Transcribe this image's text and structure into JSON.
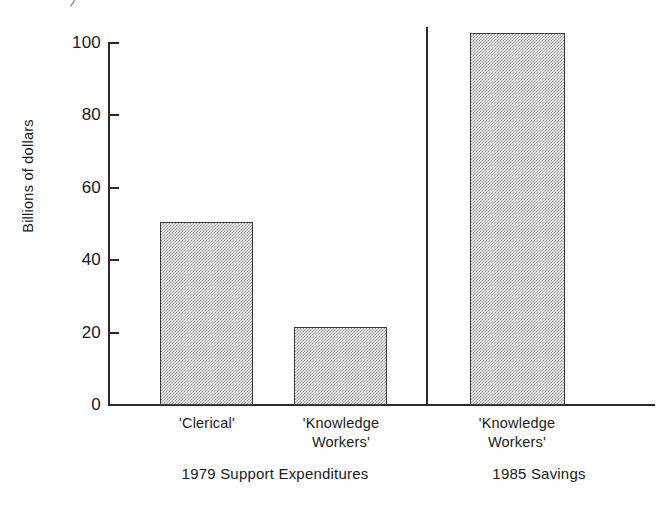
{
  "chart_data": {
    "type": "bar",
    "title": "",
    "subtitle": "",
    "xlabel": "",
    "ylabel": "Billions of dollars",
    "ylim": [
      0,
      110
    ],
    "yticks": [
      0,
      20,
      40,
      60,
      80,
      100
    ],
    "ytick_labels": [
      "0",
      "20",
      "40",
      "60",
      "80",
      "100"
    ],
    "grid": false,
    "legend": "none",
    "categories": [
      "'Clerical'",
      "'Knowledge\nWorkers'",
      "'Knowledge\nWorkers'"
    ],
    "values": [
      50.5,
      21.5,
      102.5
    ],
    "series": [
      {
        "name": "Billions of dollars",
        "values": [
          50.5,
          21.5,
          102.5
        ]
      }
    ],
    "group_captions": [
      "1979 Support Expenditures",
      "1985 Savings"
    ],
    "group_membership": [
      0,
      0,
      1
    ],
    "annotations": [
      {
        "type": "divider",
        "text": "",
        "note": "vertical rule separating the 1979 group from the 1985 group"
      }
    ],
    "bar_fill": "#efefef",
    "bar_pattern": "fine checkerboard dots",
    "bar_edge_color": "#3a3a3a",
    "axis_color": "#2b2b2b"
  },
  "axis": {
    "y_title": "Billions of dollars",
    "ticks": [
      {
        "label": "100",
        "value": 100
      },
      {
        "label": "80",
        "value": 80
      },
      {
        "label": "60",
        "value": 60
      },
      {
        "label": "40",
        "value": 40
      },
      {
        "label": "20",
        "value": 20
      },
      {
        "label": "0",
        "value": 0
      }
    ]
  },
  "bars": [
    {
      "label": "'Clerical'",
      "value": 50.5
    },
    {
      "label": "'Knowledge\nWorkers'",
      "value": 21.5
    },
    {
      "label": "'Knowledge\nWorkers'",
      "value": 102.5
    }
  ],
  "groups": [
    {
      "caption": "1979 Support Expenditures"
    },
    {
      "caption": "1985 Savings"
    }
  ],
  "artifact": {
    "glyph": "/"
  }
}
